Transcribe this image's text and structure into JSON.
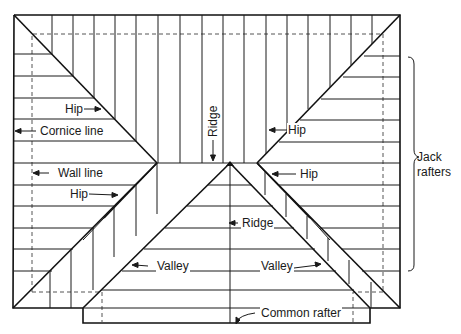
{
  "labels": {
    "hip_left_top": "Hip",
    "cornice_line": "Cornice line",
    "ridge_vertical": "Ridge",
    "hip_right_top": "Hip",
    "wall_line": "Wall line",
    "hip_left_mid": "Hip",
    "hip_right_mid": "Hip",
    "ridge_center": "Ridge",
    "valley_left": "Valley",
    "valley_right": "Valley",
    "common_rafter": "Common rafter",
    "jack_rafters_1": "Jack",
    "jack_rafters_2": "rafters"
  },
  "colors": {
    "line": "#1a1a1a",
    "dash": "#555555",
    "background": "#ffffff"
  }
}
